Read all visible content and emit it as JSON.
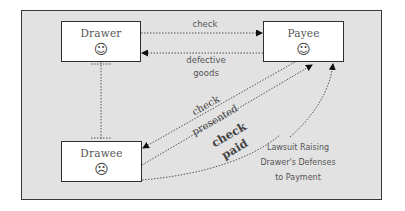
{
  "diagram": {
    "nodes": {
      "drawer": {
        "label": "Drawer",
        "emotion": "☺",
        "emotion_name": "happy"
      },
      "payee": {
        "label": "Payee",
        "emotion": "☺",
        "emotion_name": "happy"
      },
      "drawee": {
        "label": "Drawee",
        "emotion": "☹",
        "emotion_name": "sad"
      }
    },
    "edges": [
      {
        "from": "Drawer",
        "to": "Payee",
        "label": "check",
        "style": "dotted-arrow"
      },
      {
        "from": "Payee",
        "to": "Drawer",
        "label": "defective goods",
        "style": "dotted-arrow"
      },
      {
        "from": "Drawer",
        "to": "Drawee",
        "label": "",
        "style": "dotted-line"
      },
      {
        "from": "Payee",
        "to": "Drawee",
        "label": "check presented",
        "style": "dotted-arrow"
      },
      {
        "from": "Drawee",
        "to": "Payee",
        "label": "check paid",
        "style": "dotted-arrow"
      },
      {
        "from": "Drawee",
        "to": "Payee",
        "label": "Lawsuit Raising Drawer's Defenses to Payment",
        "style": "dotted-curved-arrow"
      }
    ],
    "labels": {
      "check": "check",
      "defective_1": "defective",
      "defective_2": "goods",
      "presented_1": "check",
      "presented_2": "presented",
      "paid_1": "check",
      "paid_2": "paid",
      "lawsuit_1": "Lawsuit Raising",
      "lawsuit_2": "Drawer's Defenses",
      "lawsuit_3": "to Payment"
    },
    "colors": {
      "background": "#e2e2e2",
      "box_fill": "#ffffff",
      "border": "#2e2e2e",
      "line": "#555555"
    }
  }
}
